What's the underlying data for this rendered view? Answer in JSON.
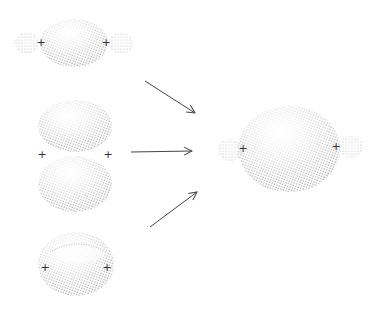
{
  "diagram": {
    "colors": {
      "background": "#ffffff",
      "stipple": "#555555",
      "arrow": "#444444",
      "sign": "#333333"
    },
    "left_figures": [
      {
        "id": "sigma-overlap",
        "shape": "central ellipsoid with two small end lobes",
        "signs": [
          "+",
          "+"
        ]
      },
      {
        "id": "pi-pair",
        "shape": "two stacked ellipsoid lobes (upper and lower)",
        "signs": [
          "+",
          "+"
        ]
      },
      {
        "id": "ring-donut",
        "shape": "torus-like ellipsoid with inner ring",
        "signs": [
          "+",
          "+"
        ]
      }
    ],
    "arrows": [
      {
        "from": "sigma-overlap",
        "to": "result"
      },
      {
        "from": "pi-pair",
        "to": "result"
      },
      {
        "from": "ring-donut",
        "to": "result"
      }
    ],
    "result_figure": {
      "id": "result",
      "shape": "large ellipsoid with two small end lobes",
      "signs": [
        "+",
        "+"
      ]
    }
  }
}
